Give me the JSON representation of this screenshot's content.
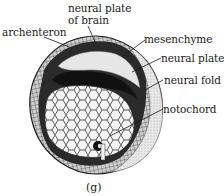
{
  "figure": {
    "panel_label": "(g)",
    "labels": {
      "neural_plate_of_brain_line1": "neural plate",
      "neural_plate_of_brain_line2": "of brain",
      "archenteron": "archenteron",
      "mesenchyme": "mesenchyme",
      "neural_plate": "neural plate",
      "neural_fold": "neural fold",
      "notochord": "notochord"
    },
    "colors": {
      "ink": "#1a1a1a",
      "shade_dark": "#2a2a2a",
      "shade_mid": "#8a8a8a",
      "shade_light": "#d9d9d9",
      "yolk_cells": "#f4f4f4",
      "background": "#ffffff"
    }
  }
}
